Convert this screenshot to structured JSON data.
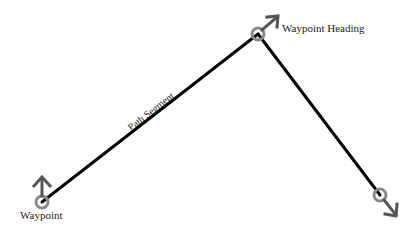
{
  "diagram": {
    "labels": {
      "waypoint": "Waypoint",
      "waypoint_heading": "Waypoint Heading",
      "path_segment": "Path Segment"
    },
    "colors": {
      "path": "#000000",
      "waypoint_circle": "#8a8a8a",
      "heading_arrow": "#555555",
      "text": "#222222"
    },
    "waypoints": [
      {
        "x": 42,
        "y": 202,
        "heading": "up"
      },
      {
        "x": 258,
        "y": 34,
        "heading": "up-right"
      },
      {
        "x": 380,
        "y": 195,
        "heading": "down-right"
      }
    ]
  }
}
